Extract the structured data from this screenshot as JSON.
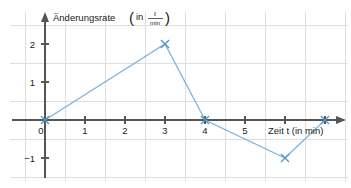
{
  "chart_data": {
    "type": "line",
    "title": "",
    "xlabel": "Zeit t (in min)",
    "ylabel": "Änderungsrate (in ℓ/min)",
    "ylabel_main": "Änderungsrate",
    "ylabel_unit_prefix": "in",
    "ylabel_unit_numerator": "ℓ",
    "ylabel_unit_denominator": "min",
    "x": [
      0,
      3,
      4,
      6,
      7
    ],
    "values": [
      0,
      2,
      0,
      -1,
      0
    ],
    "series": [
      {
        "name": "Änderungsrate",
        "points": [
          {
            "x": 0,
            "y": 0
          },
          {
            "x": 3,
            "y": 2
          },
          {
            "x": 4,
            "y": 0
          },
          {
            "x": 6,
            "y": -1
          },
          {
            "x": 7,
            "y": 0
          }
        ]
      }
    ],
    "xlim": [
      -0.55,
      7.6
    ],
    "ylim": [
      -1.85,
      2.75
    ],
    "xticks": [
      0,
      1,
      2,
      3,
      4,
      5,
      6,
      7
    ],
    "xtick_labels": [
      "0",
      "1",
      "2",
      "3",
      "4",
      "5",
      "",
      ""
    ],
    "yticks": [
      -1,
      1,
      2
    ],
    "ytick_labels": [
      "−1",
      "1",
      "2"
    ],
    "grid": true,
    "grid_color": "#dedede",
    "line_color": "#7fb4dc",
    "marker_color": "#4f94c6",
    "marker": "x",
    "axis_color": "#555555",
    "legend": "none"
  },
  "labels": {
    "y_axis_title": "Änderungsrate",
    "x_axis_title": "Zeit t (in min)",
    "unit_in": "in",
    "unit_numerator": "ℓ",
    "unit_denominator": "min",
    "paren_open": "(",
    "paren_close": ")",
    "x0": "0",
    "x1": "1",
    "x2": "2",
    "x3": "3",
    "x4": "4",
    "x5": "5",
    "y1": "1",
    "y2": "2",
    "ym1": "−1"
  }
}
